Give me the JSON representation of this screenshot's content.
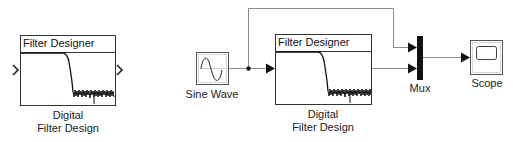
{
  "diagram": {
    "type": "simulink-model",
    "blocks": [
      {
        "id": "dfd_standalone",
        "title": "Filter Designer",
        "label_line1": "Digital",
        "label_line2": "Filter Design",
        "icon": "lowpass-filter-response-icon"
      },
      {
        "id": "sine",
        "label": "Sine Wave",
        "icon": "sine-wave-icon"
      },
      {
        "id": "dfd_connected",
        "title": "Filter Designer",
        "label_line1": "Digital",
        "label_line2": "Filter Design",
        "icon": "lowpass-filter-response-icon"
      },
      {
        "id": "mux",
        "label": "Mux",
        "icon": "mux-bar-icon"
      },
      {
        "id": "scope",
        "label": "Scope",
        "icon": "scope-screen-icon"
      }
    ],
    "connections": [
      {
        "from": "sine",
        "to": "dfd_connected"
      },
      {
        "from": "sine",
        "to": "mux",
        "port": 1
      },
      {
        "from": "dfd_connected",
        "to": "mux",
        "port": 2
      },
      {
        "from": "mux",
        "to": "scope"
      }
    ],
    "colors": {
      "line": "#8c8c8c",
      "block_border": "#333333",
      "mux_fill": "#111111"
    }
  }
}
